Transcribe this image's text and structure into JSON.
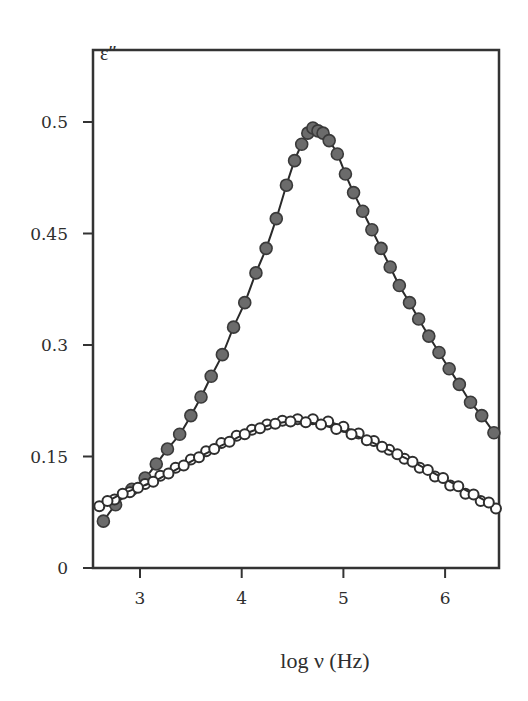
{
  "chart_data": {
    "type": "scatter",
    "title": "",
    "xlabel": "log ν (Hz)",
    "ylabel": "ε″",
    "xlim": [
      2.54,
      6.53
    ],
    "ylim": [
      0,
      0.65
    ],
    "grid": false,
    "legend": null,
    "x_ticks": [
      3,
      4,
      5,
      6
    ],
    "x_tick_labels": [
      "3",
      "4",
      "5",
      "6"
    ],
    "y_ticks": [
      0,
      0.15,
      0.3,
      0.45,
      0.6
    ],
    "y_tick_labels": [
      "0",
      "0.15",
      "0.3",
      "0.45",
      "0.5"
    ],
    "series": [
      {
        "name": "filled circles (with fit line)",
        "marker": "filled-circle",
        "color": "#6b6b6b",
        "x": [
          2.64,
          2.76,
          2.92,
          3.05,
          3.16,
          3.27,
          3.39,
          3.5,
          3.6,
          3.7,
          3.81,
          3.92,
          4.03,
          4.14,
          4.24,
          4.34,
          4.44,
          4.52,
          4.59,
          4.65,
          4.7,
          4.75,
          4.8,
          4.86,
          4.94,
          5.02,
          5.1,
          5.19,
          5.28,
          5.37,
          5.46,
          5.55,
          5.65,
          5.74,
          5.84,
          5.94,
          6.04,
          6.14,
          6.25,
          6.36,
          6.48
        ],
        "y": [
          0.063,
          0.085,
          0.106,
          0.121,
          0.14,
          0.16,
          0.18,
          0.205,
          0.23,
          0.258,
          0.287,
          0.324,
          0.357,
          0.397,
          0.43,
          0.47,
          0.515,
          0.548,
          0.57,
          0.585,
          0.592,
          0.588,
          0.585,
          0.575,
          0.557,
          0.53,
          0.505,
          0.48,
          0.455,
          0.43,
          0.405,
          0.38,
          0.357,
          0.335,
          0.312,
          0.29,
          0.268,
          0.247,
          0.223,
          0.205,
          0.182
        ]
      },
      {
        "name": "open circles series A (with fit line)",
        "marker": "open-circle",
        "color": "#2e2e2e",
        "x": [
          2.6,
          2.75,
          2.9,
          3.05,
          3.2,
          3.35,
          3.5,
          3.65,
          3.8,
          3.95,
          4.1,
          4.25,
          4.4,
          4.55,
          4.7,
          4.85,
          5.0,
          5.15,
          5.3,
          5.45,
          5.6,
          5.75,
          5.9,
          6.05,
          6.2,
          6.35,
          6.5
        ],
        "y": [
          0.083,
          0.092,
          0.102,
          0.113,
          0.124,
          0.135,
          0.146,
          0.157,
          0.168,
          0.178,
          0.186,
          0.193,
          0.198,
          0.2,
          0.2,
          0.197,
          0.19,
          0.181,
          0.171,
          0.159,
          0.147,
          0.135,
          0.123,
          0.111,
          0.1,
          0.09,
          0.08
        ]
      },
      {
        "name": "open circles series B (with fit line)",
        "marker": "open-circle",
        "color": "#2e2e2e",
        "x": [
          2.68,
          2.83,
          2.98,
          3.13,
          3.28,
          3.43,
          3.58,
          3.73,
          3.88,
          4.03,
          4.18,
          4.33,
          4.48,
          4.63,
          4.78,
          4.93,
          5.08,
          5.23,
          5.38,
          5.53,
          5.68,
          5.83,
          5.98,
          6.13,
          6.28,
          6.43
        ],
        "y": [
          0.09,
          0.1,
          0.108,
          0.116,
          0.127,
          0.138,
          0.149,
          0.16,
          0.17,
          0.18,
          0.188,
          0.194,
          0.197,
          0.196,
          0.193,
          0.187,
          0.18,
          0.172,
          0.163,
          0.153,
          0.143,
          0.132,
          0.121,
          0.11,
          0.099,
          0.088
        ]
      }
    ]
  },
  "axes": {
    "ylabel": "ε″",
    "xlabel": "log ν (Hz)"
  }
}
